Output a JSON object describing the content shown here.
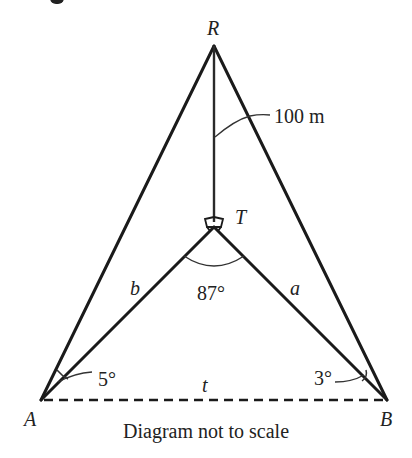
{
  "diagram": {
    "type": "geometry-3d-triangle",
    "points": {
      "R": {
        "label": "R",
        "x": 214,
        "y": 46
      },
      "T": {
        "label": "T",
        "x": 214,
        "y": 227
      },
      "A": {
        "label": "A",
        "x": 41,
        "y": 400
      },
      "B": {
        "label": "B",
        "x": 387,
        "y": 400
      }
    },
    "edges": {
      "RT": {
        "label": "100 m",
        "style": "solid"
      },
      "AT": {
        "label": "b",
        "style": "solid"
      },
      "BT": {
        "label": "a",
        "style": "solid"
      },
      "AR": {
        "label": "",
        "style": "solid"
      },
      "BR": {
        "label": "",
        "style": "solid"
      },
      "AB": {
        "label": "t",
        "style": "dashed"
      }
    },
    "angles": {
      "ATB": {
        "label": "87°"
      },
      "RAT": {
        "label": "5°"
      },
      "RBT": {
        "label": "3°"
      }
    },
    "right_angles": [
      "RTA",
      "RTB"
    ],
    "caption": "Diagram not to scale",
    "line_color": "#1a1a1a",
    "text_color": "#222222"
  }
}
